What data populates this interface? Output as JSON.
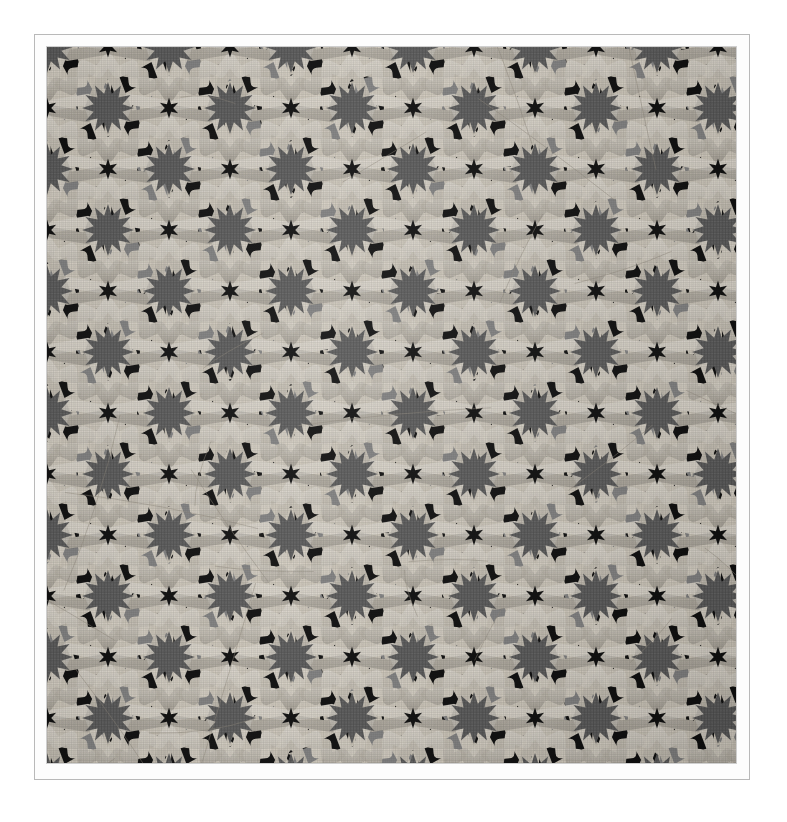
{
  "scene": {
    "kind": "photograph",
    "subject": "Islamic geometric zellij mosaic tile panel",
    "description": "Flat photographic reproduction of a carved / mosaic tile panel filled with an interlacing twelve-pointed star (khatem) strapwork pattern.",
    "presentation": "photo on a white page with a thin ruled border"
  },
  "frame": {
    "page_background": "#ffffff",
    "border_line_color": "#b9b9b9",
    "mat_background": "#fdfdfd",
    "outer_margin_px": 34,
    "inner_mat_px": 12,
    "photo": {
      "x": 47,
      "y": 47,
      "width": 689,
      "height": 716
    }
  },
  "palette": {
    "strapwork_band": "#c9c3b6",
    "strapwork_band_light": "#d8d2c6",
    "strapwork_band_shadow": "#a8a296",
    "void_black": "#0f0f0f",
    "star_center_gray": "#5a5a5a",
    "filler_gray_mid": "#808080",
    "filler_gray_dark": "#6b6b6b",
    "filler_gray_light": "#949494",
    "grout_line": "#8e887c"
  },
  "pattern": {
    "name": "twelve-pointed star strapwork (khatem ithna ashari)",
    "symmetry": "p6m-like, staggered rows",
    "lattice_spacing_px": 122,
    "row_offset_px": 61,
    "star_points": 12,
    "small_star_points": 6,
    "band_width_px": 11,
    "rosette_radius_px": 60,
    "star_core_radius_px": 26,
    "elements": [
      {
        "name": "twelve-point-star-core",
        "fill": "#5a5a5a",
        "count_visible": 30
      },
      {
        "name": "interlacing-band",
        "fill": "#c9c3b6"
      },
      {
        "name": "black-pentagon-void",
        "fill": "#0f0f0f"
      },
      {
        "name": "gray-kite-filler",
        "fill": "#808080"
      },
      {
        "name": "small-six-point-star",
        "fill": "#0f0f0f"
      }
    ]
  },
  "chart_data": {
    "type": "table",
    "columns": [
      "row",
      "y",
      "x_positions"
    ],
    "rows": [
      [
        1,
        103,
        "-20, 102, 224, 346, 468, 590, 712"
      ],
      [
        2,
        164,
        "41, 163, 285, 407, 529, 651, 773"
      ],
      [
        3,
        225,
        "-20, 102, 224, 346, 468, 590, 712"
      ],
      [
        4,
        286,
        "41, 163, 285, 407, 529, 651, 773"
      ],
      [
        5,
        347,
        "-20, 102, 224, 346, 468, 590, 712"
      ],
      [
        6,
        408,
        "41, 163, 285, 407, 529, 651, 773"
      ],
      [
        7,
        469,
        "-20, 102, 224, 346, 468, 590, 712"
      ],
      [
        8,
        530,
        "41, 163, 285, 407, 529, 651, 773"
      ],
      [
        9,
        591,
        "-20, 102, 224, 346, 468, 590, 712"
      ],
      [
        10,
        652,
        "41, 163, 285, 407, 529, 651, 773"
      ],
      [
        11,
        713,
        "-20, 102, 224, 346, 468, 590, 712"
      ]
    ],
    "xlabel": "x (px)",
    "ylabel": "y (px)",
    "grid": false
  }
}
